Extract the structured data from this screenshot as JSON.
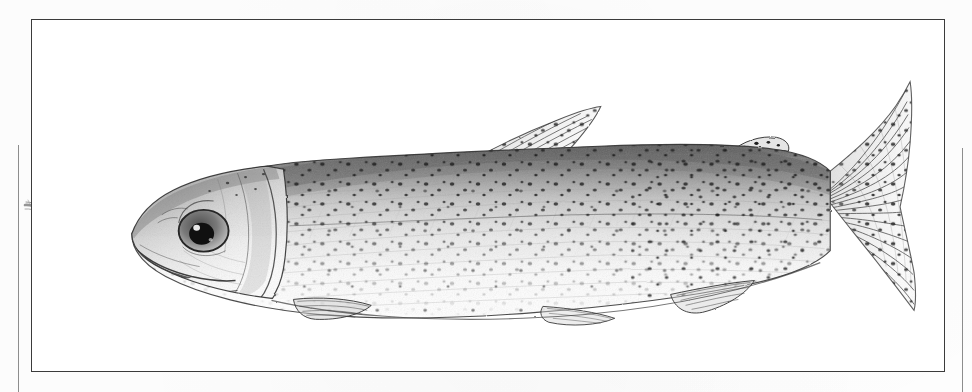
{
  "plate": {
    "medium": "pen-and-ink stipple illustration",
    "subject": "trout",
    "orientation": "left-facing lateral view",
    "background_color": "#ffffff",
    "ink_color": "#2a2a2a",
    "frame": {
      "border_color": "#3b3b3b",
      "border_width_px": 1.4,
      "x": 31,
      "y": 19,
      "width": 914,
      "height": 353
    },
    "gutter_rules": [
      {
        "name": "left-rule",
        "x": 18,
        "y": 145,
        "height": 247,
        "color": "#8d8d8d"
      },
      {
        "name": "right-rule",
        "x": 962,
        "y": 148,
        "height": 244,
        "color": "#8d8d8d"
      }
    ]
  },
  "anatomy": {
    "head": {
      "label": "head",
      "eye": {
        "label": "eye",
        "pupil_color": "#111111",
        "iris_color": "#6f6f6f"
      },
      "mouth": {
        "label": "mouth"
      },
      "operculum": {
        "label": "gill cover"
      },
      "preopercle": {
        "label": "preopercle"
      }
    },
    "body": {
      "label": "body",
      "dorsal_shading": "dark stippled",
      "ventral_shading": "pale",
      "lateral_line": {
        "label": "lateral line"
      },
      "spot_pattern": "fine dark spots, densest dorsally and on caudal peduncle"
    },
    "fins": [
      {
        "name": "dorsal-fin",
        "label": "dorsal fin",
        "spotted": true
      },
      {
        "name": "adipose-fin",
        "label": "adipose fin",
        "spotted": true
      },
      {
        "name": "caudal-fin",
        "label": "caudal fin",
        "spotted": true
      },
      {
        "name": "pectoral-fin",
        "label": "pectoral fin",
        "spotted": false
      },
      {
        "name": "pelvic-fin",
        "label": "pelvic fin",
        "spotted": false
      },
      {
        "name": "anal-fin",
        "label": "anal fin",
        "spotted": false
      }
    ],
    "stray_mark": {
      "label": "stray pencil stroke",
      "x": 48,
      "y": 212
    }
  }
}
